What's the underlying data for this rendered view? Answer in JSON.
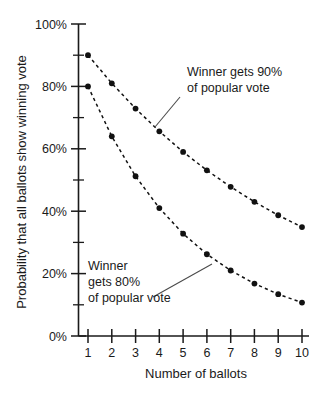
{
  "chart_data": {
    "type": "line",
    "title": "",
    "xlabel": "Number of ballots",
    "ylabel": "Probability that all ballots show winning vote",
    "x": [
      1,
      2,
      3,
      4,
      5,
      6,
      7,
      8,
      9,
      10
    ],
    "xlim": [
      0.5,
      10.5
    ],
    "ylim": [
      0,
      100
    ],
    "grid": false,
    "legend_position": "inline-annotations",
    "xticklabels": [
      "1",
      "2",
      "3",
      "4",
      "5",
      "6",
      "7",
      "8",
      "9",
      "10"
    ],
    "yticks": [
      0,
      20,
      40,
      60,
      80,
      100
    ],
    "yticklabels": [
      "0%",
      "20%",
      "40%",
      "60%",
      "80%",
      "100%"
    ],
    "yminorticks": [
      10,
      30,
      50,
      70,
      90
    ],
    "series": [
      {
        "name": "Winner gets 90% of popular vote",
        "values": [
          90.0,
          81.0,
          72.9,
          65.6,
          59.0,
          53.1,
          47.8,
          43.0,
          38.7,
          34.9
        ],
        "linestyle": "dashed",
        "marker": "circle",
        "color": "#111111"
      },
      {
        "name": "Winner gets 80% of popular vote",
        "values": [
          80.0,
          64.0,
          51.2,
          41.0,
          32.8,
          26.2,
          21.0,
          16.8,
          13.4,
          10.7
        ],
        "linestyle": "dashed",
        "marker": "circle",
        "color": "#111111"
      }
    ],
    "annotations": [
      {
        "id": "upper",
        "lines": [
          "Winner gets 90%",
          "of popular vote"
        ],
        "points_to_series": "Winner gets 90% of popular vote",
        "points_to_x": 4
      },
      {
        "id": "lower",
        "lines": [
          "Winner",
          "gets 80%",
          "of popular vote"
        ],
        "points_to_series": "Winner gets 80% of popular vote",
        "points_to_x": 6.5
      }
    ]
  }
}
